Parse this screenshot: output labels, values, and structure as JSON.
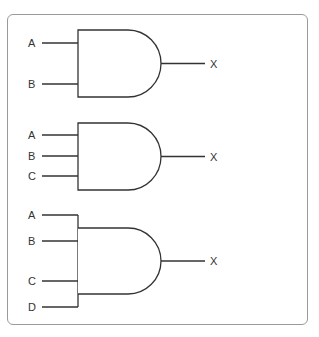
{
  "diagram": {
    "type": "logic-gates",
    "gates": [
      {
        "type": "AND",
        "inputs": [
          "A",
          "B"
        ],
        "output": "X"
      },
      {
        "type": "AND",
        "inputs": [
          "A",
          "B",
          "C"
        ],
        "output": "X"
      },
      {
        "type": "AND",
        "inputs": [
          "A",
          "B",
          "C",
          "D"
        ],
        "output": "X"
      }
    ],
    "colors": {
      "line": "#333333",
      "frame": "#9a9a9a",
      "background": "#ffffff"
    }
  }
}
